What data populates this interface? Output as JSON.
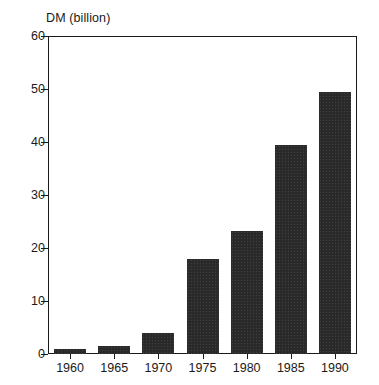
{
  "chart_data": {
    "type": "bar",
    "title": "",
    "ylabel": "DM (billion)",
    "xlabel": "",
    "categories": [
      "1960",
      "1965",
      "1970",
      "1975",
      "1980",
      "1985",
      "1990"
    ],
    "values": [
      1.0,
      1.5,
      4.0,
      18.0,
      23.3,
      39.5,
      49.4
    ],
    "ylim": [
      0,
      60
    ],
    "yticks": [
      0,
      10,
      20,
      30,
      40,
      50,
      60
    ],
    "ytick_labels": [
      "0",
      "10",
      "20",
      "30",
      "40",
      "50",
      "60"
    ],
    "grid": false,
    "legend": null,
    "bar_color": "#2a2a2a",
    "axis_color": "#1a1a1a",
    "background_color": "#ffffff"
  }
}
